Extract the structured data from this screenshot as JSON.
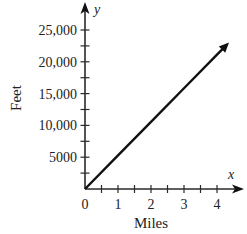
{
  "chart_data": {
    "type": "line",
    "title": "",
    "xlabel": "Miles",
    "ylabel": "Feet",
    "x_axis_variable": "x",
    "y_axis_variable": "y",
    "x_ticks": [
      0,
      1,
      2,
      3,
      4
    ],
    "x_tick_labels": [
      "0",
      "1",
      "2",
      "3",
      "4"
    ],
    "x_minor_step": 0.5,
    "y_ticks": [
      5000,
      10000,
      15000,
      20000,
      25000
    ],
    "y_tick_labels": [
      "5000",
      "10,000",
      "15,000",
      "20,000",
      "25,000"
    ],
    "y_minor_step": 2500,
    "xlim": [
      0,
      4.5
    ],
    "ylim": [
      0,
      27500
    ],
    "grid": false,
    "legend": null,
    "series": [
      {
        "name": "Feet vs Miles",
        "x": [
          0,
          1,
          2,
          3,
          4,
          4.3
        ],
        "y": [
          0,
          5280,
          10560,
          15840,
          21120,
          22704
        ],
        "slope": 5280,
        "arrow_end": true,
        "color": "#111111"
      }
    ]
  }
}
